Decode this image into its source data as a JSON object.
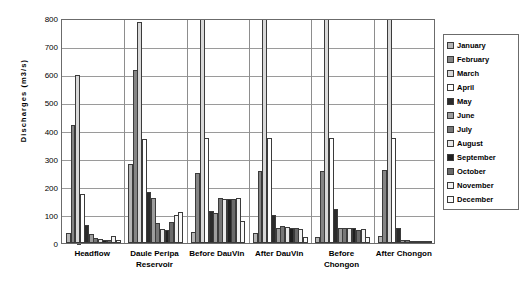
{
  "chart_data": {
    "type": "bar",
    "title": "",
    "subtitle": "",
    "xlabel": "",
    "ylabel": "Discharges (m3/s)",
    "ylim": [
      0,
      800
    ],
    "ytick_step": 100,
    "yticks": [
      "0",
      "100",
      "200",
      "300",
      "400",
      "500",
      "600",
      "700",
      "800"
    ],
    "grid": true,
    "legend_position": "right",
    "categories": [
      "Headflow",
      "Daule Peripa Reservoir",
      "Before DauVin",
      "After DauVin",
      "Before Chongon",
      "After Chongon"
    ],
    "category_lines": [
      [
        "Headflow"
      ],
      [
        "Daule Peripa",
        "Reservoir"
      ],
      [
        "Before DauVin"
      ],
      [
        "After DauVin"
      ],
      [
        "Before Chongon"
      ],
      [
        "After Chongon"
      ]
    ],
    "series": [
      {
        "name": "January",
        "color": "#b5b5b5",
        "values": [
          35,
          280,
          40,
          35,
          20,
          25
        ]
      },
      {
        "name": "February",
        "color": "#858585",
        "values": [
          420,
          615,
          250,
          255,
          255,
          260
        ]
      },
      {
        "name": "March",
        "color": "#d8d8d8",
        "values": [
          597,
          785,
          800,
          800,
          800,
          800
        ]
      },
      {
        "name": "April",
        "color": "#ffffff",
        "values": [
          173,
          370,
          375,
          375,
          375,
          375
        ]
      },
      {
        "name": "May",
        "color": "#2b2b2b",
        "values": [
          65,
          180,
          115,
          100,
          120,
          55
        ]
      },
      {
        "name": "June",
        "color": "#9d9d9d",
        "values": [
          32,
          160,
          105,
          55,
          55,
          12
        ]
      },
      {
        "name": "July",
        "color": "#777777",
        "values": [
          18,
          70,
          160,
          60,
          55,
          10
        ]
      },
      {
        "name": "August",
        "color": "#e8e8e8",
        "values": [
          14,
          50,
          155,
          58,
          55,
          8
        ]
      },
      {
        "name": "September",
        "color": "#1f1f1f",
        "values": [
          11,
          45,
          155,
          55,
          52,
          7
        ]
      },
      {
        "name": "October",
        "color": "#6a6a6a",
        "values": [
          10,
          75,
          155,
          52,
          48,
          6
        ]
      },
      {
        "name": "November",
        "color": "#f2f2f2",
        "values": [
          26,
          100,
          160,
          50,
          50,
          6
        ]
      },
      {
        "name": "December",
        "color": "#fafafa",
        "values": [
          12,
          110,
          80,
          22,
          22,
          5
        ]
      }
    ]
  },
  "legend": {
    "items": [
      {
        "label": "January"
      },
      {
        "label": "February"
      },
      {
        "label": "March"
      },
      {
        "label": "April"
      },
      {
        "label": "May"
      },
      {
        "label": "June"
      },
      {
        "label": "July"
      },
      {
        "label": "August"
      },
      {
        "label": "September"
      },
      {
        "label": "October"
      },
      {
        "label": "November"
      },
      {
        "label": "December"
      }
    ]
  }
}
